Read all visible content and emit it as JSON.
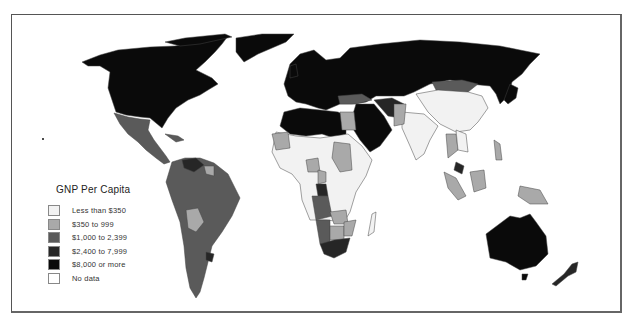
{
  "map": {
    "title": "GNP Per Capita",
    "type": "choropleth world map"
  },
  "legend": {
    "title": "GNP Per Capita",
    "items": [
      {
        "label": "Less than $350",
        "color": "#f2f2f2"
      },
      {
        "label": "$350 to 999",
        "color": "#a9a9a9"
      },
      {
        "label": "$1,000 to 2,399",
        "color": "#5a5a5a"
      },
      {
        "label": "$2,400 to 7,999",
        "color": "#262626"
      },
      {
        "label": "$8,000 or more",
        "color": "#0a0a0a"
      },
      {
        "label": "No data",
        "color": "#ffffff"
      }
    ]
  },
  "colors": {
    "low": "#f2f2f2",
    "lower_middle": "#a9a9a9",
    "middle": "#5a5a5a",
    "upper_middle": "#262626",
    "high": "#0a0a0a",
    "no_data": "#ffffff",
    "border": "#555555"
  }
}
